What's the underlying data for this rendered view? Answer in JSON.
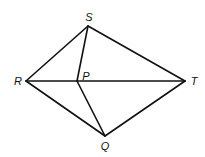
{
  "diagram": {
    "points": {
      "S": {
        "label": "S",
        "x": 88,
        "y": 26,
        "lx": 89,
        "ly": 21
      },
      "R": {
        "label": "R",
        "x": 26,
        "y": 81,
        "lx": 18,
        "ly": 85
      },
      "P": {
        "label": "P",
        "x": 77,
        "y": 81,
        "lx": 86,
        "ly": 80
      },
      "T": {
        "label": "T",
        "x": 185,
        "y": 81,
        "lx": 194,
        "ly": 85
      },
      "Q": {
        "label": "Q",
        "x": 105,
        "y": 136,
        "lx": 105,
        "ly": 150
      }
    },
    "segments": [
      [
        "R",
        "S"
      ],
      [
        "S",
        "T"
      ],
      [
        "T",
        "Q"
      ],
      [
        "Q",
        "R"
      ],
      [
        "R",
        "T"
      ],
      [
        "S",
        "P"
      ],
      [
        "P",
        "Q"
      ]
    ]
  }
}
